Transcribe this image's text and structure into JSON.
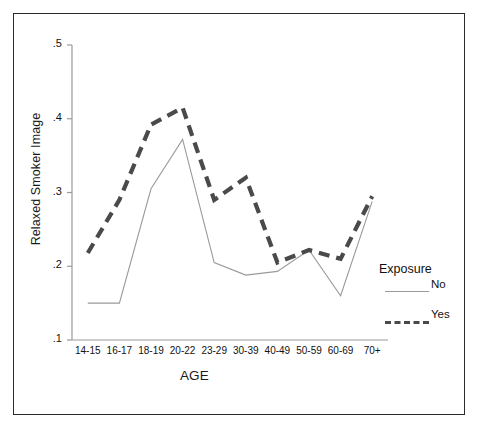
{
  "figure": {
    "kind": "line-chart",
    "background": "#ffffff",
    "frame_color": "#2b2b2b"
  },
  "legend": {
    "title": "Exposure",
    "position": "right",
    "entries": [
      {
        "label": "No",
        "style": "solid-thin",
        "color": "#9a9a9a"
      },
      {
        "label": "Yes",
        "style": "dashed-thick",
        "color": "#4a4a4a"
      }
    ]
  },
  "chart_data": {
    "type": "line",
    "title": "",
    "xlabel": "AGE",
    "ylabel": "Relaxed Smoker Image",
    "categories": [
      "14-15",
      "16-17",
      "18-19",
      "20-22",
      "23-29",
      "30-39",
      "40-49",
      "50-59",
      "60-69",
      "70+"
    ],
    "ylim": [
      0.1,
      0.5
    ],
    "yticks": [
      0.1,
      0.2,
      0.3,
      0.4,
      0.5
    ],
    "ytick_labels": [
      ".1",
      ".2",
      ".3",
      ".4",
      ".5"
    ],
    "grid": false,
    "legend_position": "right",
    "series": [
      {
        "name": "No",
        "style": "solid-thin",
        "color": "#9a9a9a",
        "values": [
          0.15,
          0.15,
          0.305,
          0.372,
          0.205,
          0.188,
          0.193,
          0.222,
          0.16,
          0.288
        ]
      },
      {
        "name": "Yes",
        "style": "dashed-thick",
        "color": "#4a4a4a",
        "values": [
          0.218,
          0.29,
          0.392,
          0.415,
          0.29,
          0.32,
          0.205,
          0.222,
          0.21,
          0.295
        ]
      }
    ]
  }
}
